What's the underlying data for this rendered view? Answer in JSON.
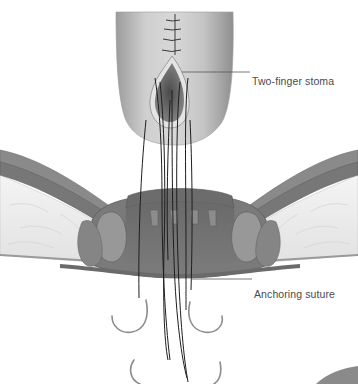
{
  "figure": {
    "colors": {
      "background": "#ffffff",
      "bowel": "#c8c8c8",
      "bowel_shadow": "#8a8a8a",
      "muscle": "#7e7e7e",
      "muscle_dark": "#5e5e5e",
      "fat": "#ececec",
      "suture": "#1e1e1e",
      "needle": "#8c8c8c",
      "leader_line": "#555555",
      "label_text": "#4a4a4a"
    },
    "labels": [
      {
        "id": "stoma",
        "text": "Two-finger stoma",
        "pointer_from": [
          182,
          72
        ],
        "pointer_to": [
          250,
          72
        ]
      },
      {
        "id": "anchor",
        "text": "Anchoring suture",
        "pointer_from": [
          191,
          279
        ],
        "pointer_to": [
          252,
          279
        ]
      }
    ]
  }
}
